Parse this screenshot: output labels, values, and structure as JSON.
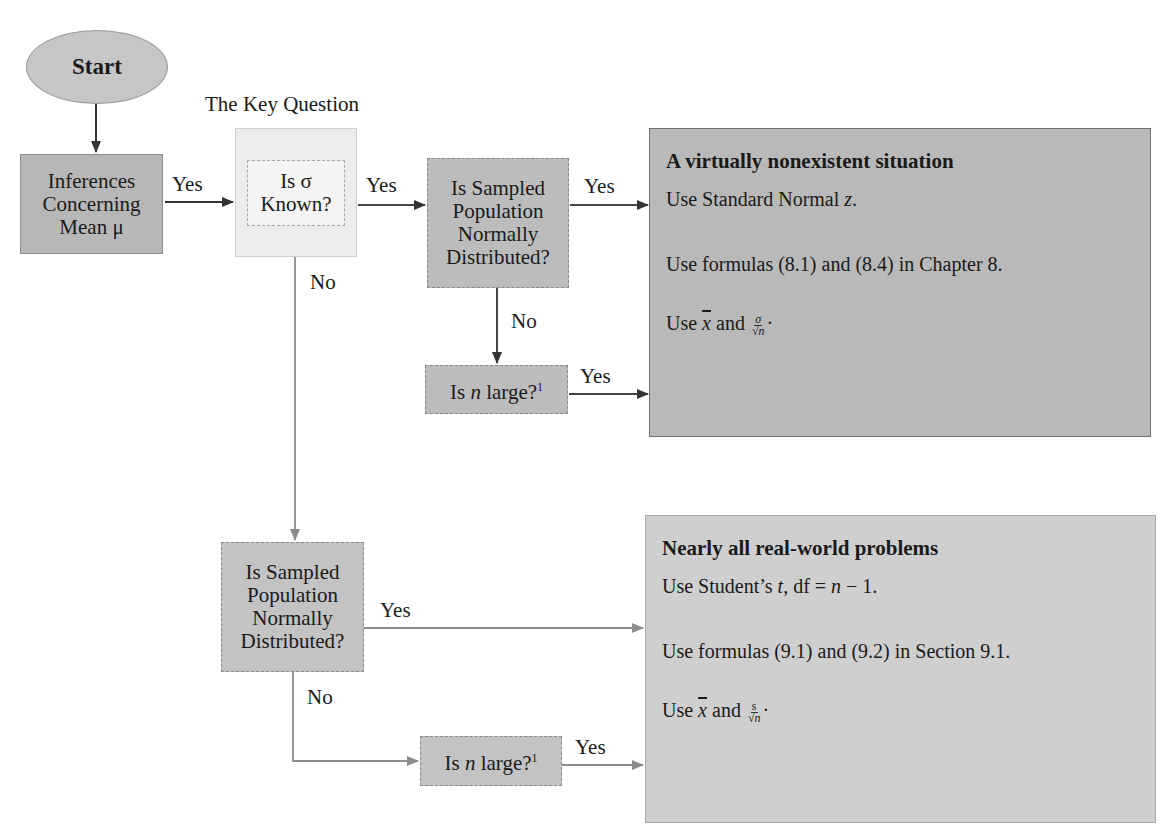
{
  "diagram": {
    "start": {
      "label": "Start"
    },
    "key_question_label": "The Key Question",
    "nodes": {
      "inferences": {
        "lines": [
          "Inferences",
          "Concerning",
          "Mean μ"
        ]
      },
      "sigma_known": {
        "line1": "Is σ",
        "line2": "Known?"
      },
      "normal_pop_top": {
        "lines": [
          "Is Sampled",
          "Population",
          "Normally",
          "Distributed?"
        ]
      },
      "n_large_top": {
        "prefix": "Is ",
        "var": "n",
        "suffix": " large?",
        "footnote": "1"
      },
      "normal_pop_bottom": {
        "lines": [
          "Is Sampled",
          "Population",
          "Normally",
          "Distributed?"
        ]
      },
      "n_large_bottom": {
        "prefix": "Is ",
        "var": "n",
        "suffix": " large?",
        "footnote": "1"
      }
    },
    "edge_labels": {
      "inferences_to_sigma": "Yes",
      "sigma_yes": "Yes",
      "sigma_no": "No",
      "normal_top_yes": "Yes",
      "normal_top_no": "No",
      "n_large_top_yes": "Yes",
      "normal_bottom_yes": "Yes",
      "normal_bottom_no": "No",
      "n_large_bottom_yes": "Yes"
    },
    "results": {
      "top": {
        "title": "A virtually nonexistent situation",
        "line1_prefix": "Use Standard Normal ",
        "line1_var": "z",
        "line1_suffix": ".",
        "line2": "Use formulas (8.1) and (8.4) in Chapter 8.",
        "line3_prefix": "Use ",
        "line3_xbar": "x",
        "line3_mid": " and ",
        "line3_num": "σ",
        "line3_den": "√n",
        "line3_suffix": "·"
      },
      "bottom": {
        "title": "Nearly all real-world problems",
        "line1_prefix": "Use Student’s ",
        "line1_var": "t",
        "line1_mid": ", df = ",
        "line1_var2": "n",
        "line1_suffix": " − 1.",
        "line2": "Use formulas (9.1) and (9.2) in Section 9.1.",
        "line3_prefix": "Use ",
        "line3_xbar": "x",
        "line3_mid": " and ",
        "line3_num": "s",
        "line3_den": "√n",
        "line3_suffix": "·"
      }
    },
    "colors": {
      "dark_box": "#b7b7b7",
      "light_box": "#ececec",
      "result_top": "#b9b9b9",
      "result_bottom": "#cfcfcf",
      "arrow_dark": "#333333",
      "arrow_light": "#8c8c8c"
    }
  }
}
